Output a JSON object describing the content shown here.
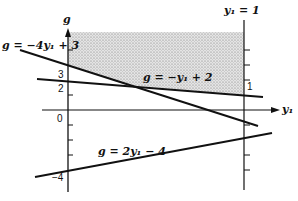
{
  "diagram": {
    "type": "linear-programming-graph",
    "axes": {
      "vertical_label": "g",
      "horizontal_label": "y₁",
      "right_vertical_label": "y₁ = 1",
      "origin_label": "0"
    },
    "tick_labels": {
      "left_3": "3",
      "left_2": "2",
      "left_minus4": "−4",
      "right_1": "1"
    },
    "lines": [
      {
        "name": "line-1",
        "label": "g = −4y₁ + 3",
        "slope": -4,
        "intercept": 3
      },
      {
        "name": "line-2",
        "label": "g = −y₁ + 2",
        "slope": -1,
        "intercept": 2
      },
      {
        "name": "line-3",
        "label": "g = 2y₁ − 4",
        "slope": 2,
        "intercept": -4
      }
    ],
    "shaded_region": "feasible region above max(−4y₁+3, −y₁+2) for 0 ≤ y₁ ≤ 1",
    "colors": {
      "ink": "#111111",
      "shade": "#cfcfcf"
    }
  }
}
